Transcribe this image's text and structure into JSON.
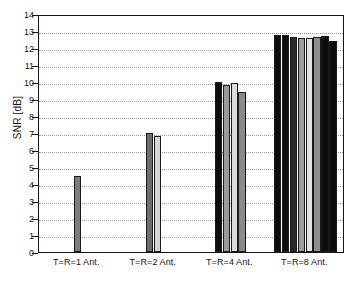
{
  "chart_data": {
    "type": "bar",
    "title": "",
    "xlabel": "",
    "ylabel": "SNR [dB]",
    "ylim": [
      0,
      14
    ],
    "yticks": [
      0,
      1,
      2,
      3,
      4,
      5,
      6,
      7,
      8,
      9,
      10,
      11,
      12,
      13,
      14
    ],
    "ytick_labels": [
      "0",
      "1",
      "2",
      "3",
      "4",
      "5",
      "6",
      "7",
      "8",
      "9",
      "10",
      "11",
      "12",
      "13",
      "14"
    ],
    "grid": true,
    "legend": "none",
    "categories": [
      "T=R=1 Ant.",
      "T=R=2 Ant.",
      "T=R=4 Ant.",
      "T=R=8 Ant."
    ],
    "groups": [
      {
        "label": "T=R=1 Ant.",
        "center_pct": 12.5,
        "bars": [
          {
            "value": 4.5,
            "color": "#7d7d7d"
          }
        ]
      },
      {
        "label": "T=R=2 Ant.",
        "center_pct": 37.5,
        "bars": [
          {
            "value": 7.02,
            "color": "#6e6e6e"
          },
          {
            "value": 6.82,
            "color": "#d5d5d5"
          }
        ]
      },
      {
        "label": "T=R=4 Ant.",
        "center_pct": 62.5,
        "bars": [
          {
            "value": 10.02,
            "color": "#0d0d0d"
          },
          {
            "value": 9.8,
            "color": "#9a9a9a"
          },
          {
            "value": 9.96,
            "color": "#dcdcdc"
          },
          {
            "value": 9.44,
            "color": "#8a8a8a"
          }
        ]
      },
      {
        "label": "T=R=8 Ant.",
        "center_pct": 87.0,
        "bars": [
          {
            "value": 12.79,
            "color": "#0d0d0d"
          },
          {
            "value": 12.74,
            "color": "#0d0d0d"
          },
          {
            "value": 12.62,
            "color": "#2a2a2a"
          },
          {
            "value": 12.58,
            "color": "#9e9e9e"
          },
          {
            "value": 12.58,
            "color": "#e2e2e2"
          },
          {
            "value": 12.67,
            "color": "#8d8d8d"
          },
          {
            "value": 12.71,
            "color": "#0d0d0d"
          },
          {
            "value": 12.44,
            "color": "#0d0d0d"
          }
        ]
      }
    ]
  },
  "colors": {
    "axis": "#151515",
    "grid": "#9a9a9a",
    "background": "#ffffff",
    "text": "#141414"
  }
}
